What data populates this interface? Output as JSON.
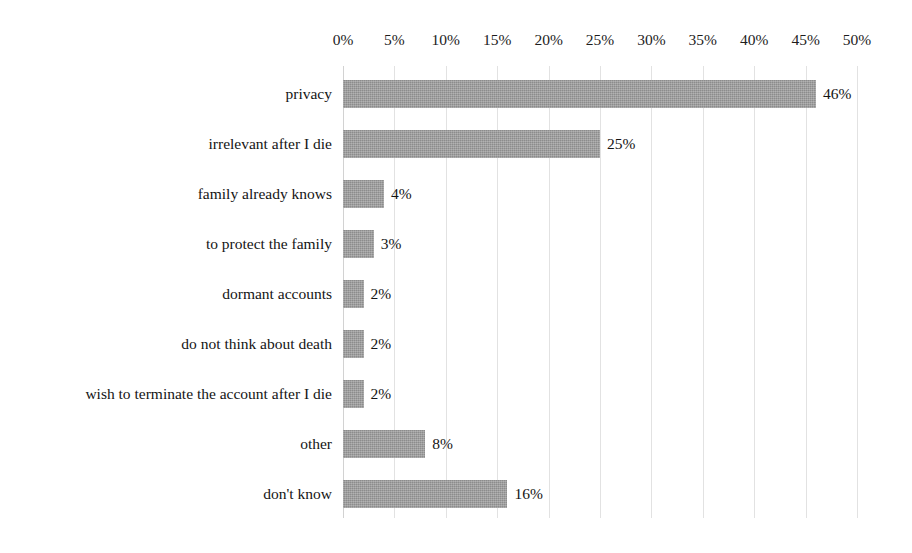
{
  "chart_data": {
    "type": "bar",
    "orientation": "horizontal",
    "title": "",
    "subtitle": "",
    "xlabel": "",
    "ylabel": "",
    "xlim": [
      0,
      50
    ],
    "x_tick_labels": [
      "0%",
      "5%",
      "10%",
      "15%",
      "20%",
      "25%",
      "30%",
      "35%",
      "40%",
      "45%",
      "50%"
    ],
    "x_ticks": [
      0,
      5,
      10,
      15,
      20,
      25,
      30,
      35,
      40,
      45,
      50
    ],
    "grid": true,
    "legend": false,
    "legend_position": "none",
    "bar_color": "#9d9d9d",
    "categories": [
      "privacy",
      "irrelevant after I die",
      "family already knows",
      "to protect the family",
      "dormant accounts",
      "do not think about death",
      "wish to terminate the account after I die",
      "other",
      "don't know"
    ],
    "values": [
      46,
      25,
      4,
      3,
      2,
      2,
      2,
      8,
      16
    ],
    "value_labels": [
      "46%",
      "25%",
      "4%",
      "3%",
      "2%",
      "2%",
      "2%",
      "8%",
      "16%"
    ]
  }
}
